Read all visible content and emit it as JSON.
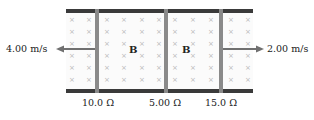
{
  "diagram": {
    "left_velocity": "4.00 m/s",
    "right_velocity": "2.00 m/s",
    "field_label_1": "B",
    "field_label_2": "B",
    "resistors": [
      "10.0 Ω",
      "5.00 Ω",
      "15.0 Ω"
    ],
    "field_symbol": "×",
    "colors": {
      "rail": "#3a3a3a",
      "bar": "#8a8a8a",
      "arrow": "#707070"
    }
  }
}
